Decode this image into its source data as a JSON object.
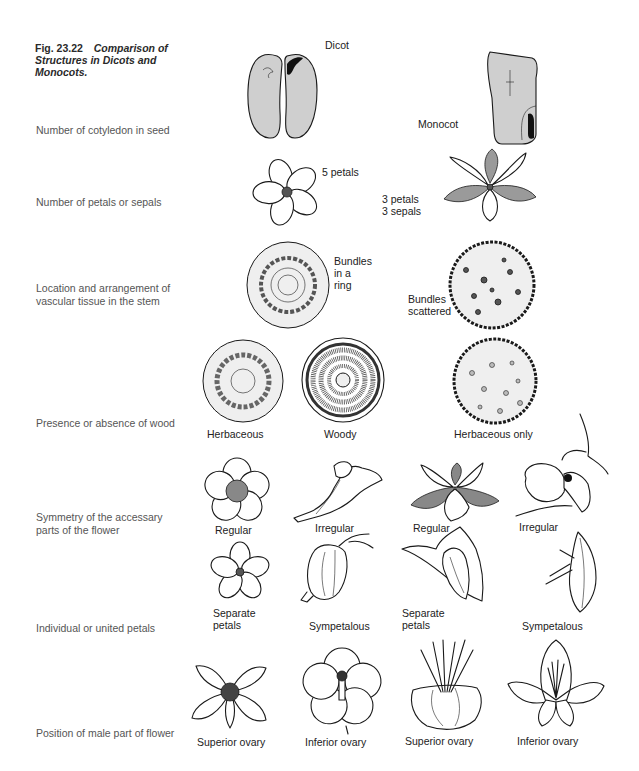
{
  "figure": {
    "number": "Fig. 23.22",
    "title": "Comparison of Structures in Dicots and Monocots."
  },
  "rows": [
    {
      "label": "Number of cotyledon in seed",
      "items": [
        {
          "name": "dicot-seed",
          "caption": "Dicot"
        },
        {
          "name": "monocot-seed",
          "caption": "Monocot"
        }
      ]
    },
    {
      "label": "Number of petals or sepals",
      "items": [
        {
          "name": "dicot-flower",
          "caption": "5 petals"
        },
        {
          "name": "monocot-flower",
          "caption": "3 petals 3 sepals",
          "lines": [
            "3 petals",
            "3 sepals"
          ]
        }
      ]
    },
    {
      "label": "Location and arrangement of vascular tissue in the stem",
      "items": [
        {
          "name": "dicot-stem",
          "caption": "Bundles in a ring",
          "lines": [
            "Bundles",
            "in a",
            "ring"
          ]
        },
        {
          "name": "monocot-stem",
          "caption": "Bundles scattered",
          "lines": [
            "Bundles",
            "scattered"
          ]
        }
      ]
    },
    {
      "label": "Presence or absence of wood",
      "items": [
        {
          "name": "herbaceous-stem",
          "caption": "Herbaceous"
        },
        {
          "name": "woody-stem",
          "caption": "Woody"
        },
        {
          "name": "monocot-herbaceous-stem",
          "caption": "Herbaceous only"
        }
      ]
    },
    {
      "label": "Symmetry of the accessary parts of the flower",
      "items": [
        {
          "name": "dicot-regular-flower",
          "caption": "Regular"
        },
        {
          "name": "dicot-irregular-flower",
          "caption": "Irregular"
        },
        {
          "name": "monocot-regular-flower",
          "caption": "Regular"
        },
        {
          "name": "monocot-irregular-flower",
          "caption": "Irregular"
        }
      ]
    },
    {
      "label": "Individual or united petals",
      "items": [
        {
          "name": "dicot-separate-petals",
          "caption": "Separate petals",
          "lines": [
            "Separate",
            "petals"
          ]
        },
        {
          "name": "dicot-sympetalous",
          "caption": "Sympetalous"
        },
        {
          "name": "monocot-separate-petals",
          "caption": "Separate petals",
          "lines": [
            "Separate",
            "petals"
          ]
        },
        {
          "name": "monocot-sympetalous",
          "caption": "Sympetalous"
        }
      ]
    },
    {
      "label": "Position of male part of flower",
      "items": [
        {
          "name": "dicot-superior-ovary",
          "caption": "Superior ovary"
        },
        {
          "name": "dicot-inferior-ovary",
          "caption": "Inferior ovary"
        },
        {
          "name": "monocot-superior-ovary",
          "caption": "Superior ovary"
        },
        {
          "name": "monocot-inferior-ovary",
          "caption": "Inferior ovary"
        }
      ]
    }
  ]
}
